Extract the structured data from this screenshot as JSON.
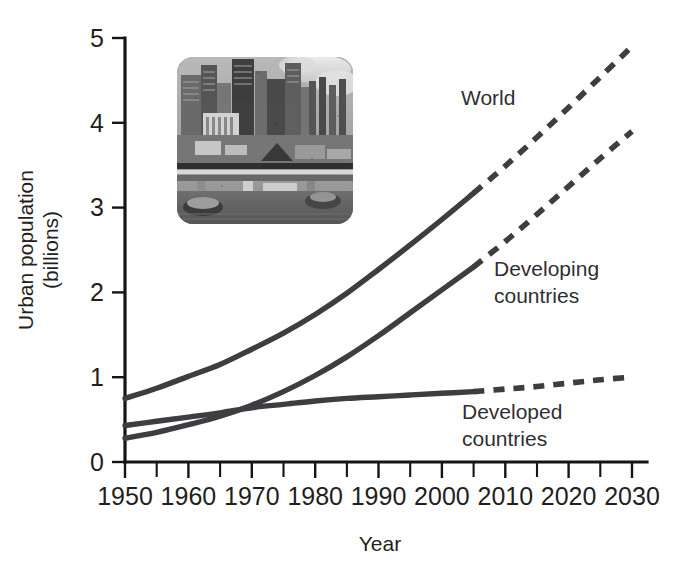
{
  "figure": {
    "background_color": "#ffffff",
    "line_color": "#3d3d42",
    "axis_color": "#151515",
    "text_color": "#231f20"
  },
  "chart_data": {
    "type": "line",
    "title": "",
    "xlabel": "Year",
    "ylabel": "Urban population (billions)",
    "ylabel_line1": "Urban population",
    "ylabel_line2": "(billions)",
    "xlim": [
      1950,
      2030
    ],
    "ylim": [
      0,
      5
    ],
    "grid": false,
    "legend_position": "inline-labels",
    "x_tick_labels": [
      "1950",
      "1960",
      "1970",
      "1980",
      "1990",
      "2000",
      "2010",
      "2020",
      "2030"
    ],
    "x_ticks": [
      1950,
      1960,
      1970,
      1980,
      1990,
      2000,
      2010,
      2020,
      2030
    ],
    "x_minor_ticks": [
      1955,
      1965,
      1975,
      1985,
      1995,
      2005,
      2015,
      2025
    ],
    "y_tick_labels": [
      "0",
      "1",
      "2",
      "3",
      "4",
      "5"
    ],
    "y_ticks": [
      0,
      1,
      2,
      3,
      4,
      5
    ],
    "projection_start_year": 2005,
    "series": [
      {
        "name": "World",
        "label": "World",
        "line_style_historical": "solid",
        "line_style_projection": "dashed",
        "x": [
          1950,
          1955,
          1960,
          1965,
          1970,
          1975,
          1980,
          1985,
          1990,
          1995,
          2000,
          2005,
          2010,
          2015,
          2020,
          2025,
          2030
        ],
        "values": [
          0.75,
          0.87,
          1.01,
          1.15,
          1.33,
          1.52,
          1.74,
          1.99,
          2.27,
          2.56,
          2.86,
          3.17,
          3.49,
          3.83,
          4.18,
          4.54,
          4.9
        ]
      },
      {
        "name": "Developing countries",
        "label": "Developing\ncountries",
        "label_line1": "Developing",
        "label_line2": "countries",
        "line_style_historical": "solid",
        "line_style_projection": "dashed",
        "x": [
          1950,
          1955,
          1960,
          1965,
          1970,
          1975,
          1980,
          1985,
          1990,
          1995,
          2000,
          2005,
          2010,
          2015,
          2020,
          2025,
          2030
        ],
        "values": [
          0.28,
          0.35,
          0.44,
          0.54,
          0.67,
          0.83,
          1.02,
          1.24,
          1.49,
          1.76,
          2.03,
          2.3,
          2.6,
          2.92,
          3.25,
          3.58,
          3.9
        ]
      },
      {
        "name": "Developed countries",
        "label": "Developed\ncountries",
        "label_line1": "Developed",
        "label_line2": "countries",
        "line_style_historical": "solid",
        "line_style_projection": "dashed",
        "x": [
          1950,
          1955,
          1960,
          1965,
          1970,
          1975,
          1980,
          1985,
          1990,
          1995,
          2000,
          2005,
          2010,
          2015,
          2020,
          2025,
          2030
        ],
        "values": [
          0.43,
          0.48,
          0.53,
          0.58,
          0.64,
          0.68,
          0.72,
          0.75,
          0.77,
          0.79,
          0.81,
          0.83,
          0.86,
          0.89,
          0.93,
          0.97,
          1.0
        ]
      }
    ],
    "annotations": [
      {
        "name": "world-label",
        "text": "World",
        "x_year": 2003,
        "y_value": 4.3
      },
      {
        "name": "developing-label-line1",
        "text": "Developing",
        "x_year": 2006,
        "y_value": 2.28
      },
      {
        "name": "developing-label-line2",
        "text": "countries",
        "x_year": 2006,
        "y_value": 1.95
      },
      {
        "name": "developed-label-line1",
        "text": "Developed",
        "x_year": 2003,
        "y_value": 0.58
      },
      {
        "name": "developed-label-line2",
        "text": "countries",
        "x_year": 2003,
        "y_value": 0.25
      }
    ]
  },
  "inset": {
    "name": "city-industrial-photo",
    "description": "Grayscale photograph of an industrial city skyline with smokestacks",
    "alt": "Urban industrial skyline"
  }
}
